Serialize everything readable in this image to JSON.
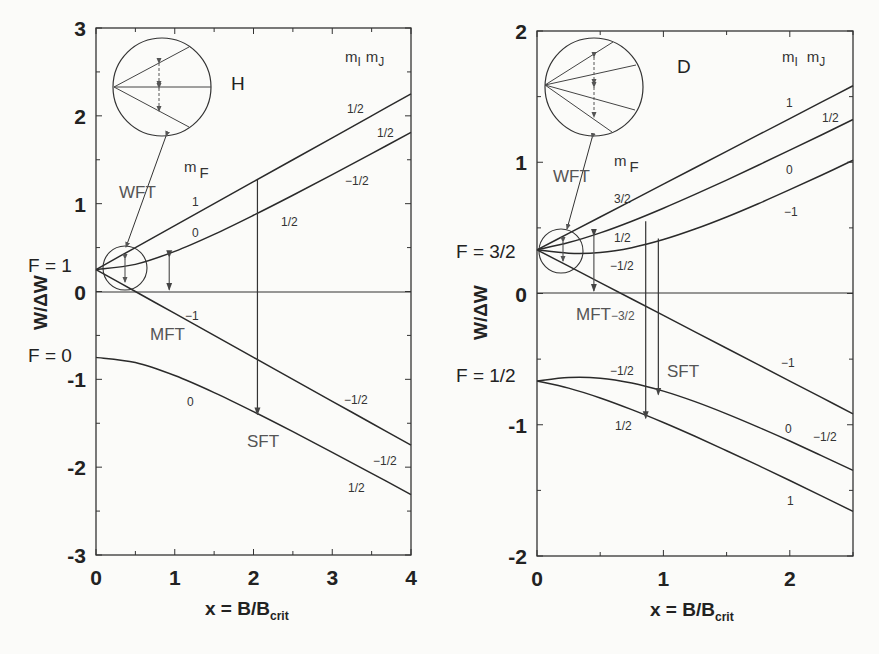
{
  "chart_data": [
    {
      "type": "line",
      "title": "H",
      "xlabel": "x = B/B_crit",
      "xlabel_main": "x = B/B",
      "xlabel_sub": "crit",
      "ylabel": "W/ΔW",
      "xlim": [
        0,
        4
      ],
      "ylim": [
        -3,
        3
      ],
      "xticks": [
        0,
        1,
        2,
        3,
        4
      ],
      "yticks": [
        -3,
        -2,
        -1,
        0,
        1,
        2,
        3
      ],
      "grid": false,
      "x": [
        0,
        0.5,
        1,
        1.5,
        2,
        2.5,
        3,
        3.5,
        4
      ],
      "series": [
        {
          "name": "mF=1 (mI=1/2, mJ=1/2)",
          "mF": "1",
          "mI": "1/2",
          "mJ": "1/2",
          "values": [
            0.25,
            0.5,
            0.75,
            1.0,
            1.25,
            1.5,
            1.75,
            2.0,
            2.25
          ]
        },
        {
          "name": "mF=0 (mI=-1/2, mJ=1/2)",
          "mF": "0",
          "mI": "-1/2",
          "mJ": "1/2",
          "values": [
            0.25,
            0.309,
            0.457,
            0.651,
            0.868,
            1.096,
            1.331,
            1.57,
            1.812
          ]
        },
        {
          "name": "mF=-1 (mI=-1/2, mJ=-1/2)",
          "mF": "-1",
          "mI": "-1/2",
          "mJ": "-1/2",
          "values": [
            0.25,
            0.0,
            -0.25,
            -0.5,
            -0.75,
            -1.0,
            -1.25,
            -1.5,
            -1.75
          ]
        },
        {
          "name": "mF=0 (mI=1/2, mJ=-1/2)",
          "mF": "0",
          "mI": "1/2",
          "mJ": "-1/2",
          "values": [
            -0.75,
            -0.809,
            -0.957,
            -1.151,
            -1.368,
            -1.596,
            -1.831,
            -2.07,
            -2.312
          ]
        }
      ],
      "annotations": {
        "element": "H",
        "level_upper": "F = 1",
        "level_lower": "F = 0",
        "mF_header": "m",
        "mF_sub": "F",
        "mI_header": "m",
        "mI_sub": "I",
        "mJ_header": "m",
        "mJ_sub": "J",
        "mF_labels": [
          "1",
          "0",
          "−1",
          "0"
        ],
        "mI_labels": [
          "1/2",
          "−1/2",
          "−1/2",
          "1/2"
        ],
        "mJ_labels": [
          "1/2",
          "1/2",
          "−1/2",
          "−1/2"
        ],
        "transitions": [
          "WFT",
          "MFT",
          "SFT"
        ],
        "arrows": [
          {
            "type": "MFT",
            "x": 0.93,
            "from": 0.39,
            "to": 0.02
          },
          {
            "type": "SFT",
            "x": 2.05,
            "from": 1.27,
            "to": -1.4
          }
        ]
      }
    },
    {
      "type": "line",
      "title": "D",
      "xlabel": "x = B/B_crit",
      "xlabel_main": "x = B/B",
      "xlabel_sub": "crit",
      "ylabel": "W/ΔW",
      "xlim": [
        0,
        2.5
      ],
      "ylim": [
        -2,
        2
      ],
      "xticks": [
        0,
        1,
        2
      ],
      "yticks": [
        -2,
        -1,
        0,
        1,
        2
      ],
      "grid": false,
      "x": [
        0,
        0.25,
        0.5,
        0.75,
        1,
        1.25,
        1.5,
        1.75,
        2,
        2.25,
        2.5
      ],
      "series": [
        {
          "name": "mF=3/2 (mI=1, mJ=1/2)",
          "mF": "3/2",
          "mI": "1",
          "mJ": "1/2",
          "values": [
            0.333,
            0.458,
            0.583,
            0.708,
            0.833,
            0.958,
            1.083,
            1.208,
            1.333,
            1.458,
            1.583
          ]
        },
        {
          "name": "mF=1/2 (mI=0, mJ=1/2)",
          "mF": "1/2",
          "mI": "0",
          "mJ": "1/2",
          "values": [
            0.333,
            0.388,
            0.462,
            0.551,
            0.65,
            0.755,
            0.864,
            0.977,
            1.092,
            1.208,
            1.326
          ]
        },
        {
          "name": "mF=-1/2 (mI=-1, mJ=1/2)",
          "mF": "-1/2",
          "mI": "-1",
          "mJ": "1/2",
          "values": [
            0.333,
            0.307,
            0.312,
            0.349,
            0.411,
            0.491,
            0.583,
            0.684,
            0.791,
            0.901,
            1.015
          ]
        },
        {
          "name": "mF=-3/2 (mI=-1, mJ=-1/2)",
          "mF": "-3/2",
          "mI": "-1",
          "mJ": "-1/2",
          "values": [
            0.333,
            0.208,
            0.083,
            -0.042,
            -0.167,
            -0.292,
            -0.417,
            -0.542,
            -0.667,
            -0.792,
            -0.917
          ]
        },
        {
          "name": "mF=-1/2 (mI=0, mJ=-1/2)",
          "mF": "-1/2",
          "mI": "0",
          "mJ": "-1/2",
          "values": [
            -0.667,
            -0.64,
            -0.645,
            -0.682,
            -0.744,
            -0.824,
            -0.917,
            -1.018,
            -1.124,
            -1.235,
            -1.348
          ]
        },
        {
          "name": "mF=1/2 (mI=1, mJ=-1/2)",
          "mF": "1/2",
          "mI": "1",
          "mJ": "-1/2",
          "values": [
            -0.667,
            -0.721,
            -0.796,
            -0.885,
            -0.983,
            -1.088,
            -1.198,
            -1.31,
            -1.425,
            -1.542,
            -1.66
          ]
        }
      ],
      "annotations": {
        "element": "D",
        "level_upper": "F = 3/2",
        "level_lower": "F = 1/2",
        "mF_header": "m",
        "mF_sub": "F",
        "mI_header": "m",
        "mI_sub": "I",
        "mJ_header": "m",
        "mJ_sub": "J",
        "mF_labels": [
          "3/2",
          "1/2",
          "−1/2",
          "−3/2",
          "−1/2",
          "1/2"
        ],
        "mI_labels": [
          "1",
          "0",
          "−1",
          "−1",
          "0",
          "1"
        ],
        "mJ_labels": [
          "1/2",
          "",
          "",
          "",
          "−1/2",
          ""
        ],
        "transitions": [
          "WFT",
          "MFT",
          "SFT"
        ],
        "mft_sub": "−3/2",
        "arrows": [
          {
            "type": "MFT",
            "x": 0.45,
            "from": 0.44,
            "to": 0.02
          },
          {
            "type": "SFT",
            "x": 0.86,
            "from": 0.55,
            "to": -0.95
          },
          {
            "type": "SFT",
            "x": 0.96,
            "from": 0.42,
            "to": -0.77
          }
        ]
      }
    }
  ]
}
